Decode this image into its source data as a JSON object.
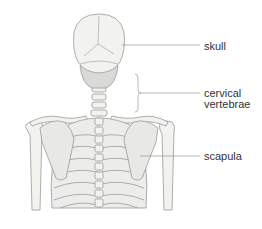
{
  "diagram": {
    "type": "anatomical-illustration",
    "colors": {
      "bone_fill": "#f2f2ef",
      "bone_outline": "#9a9a9a",
      "shadow": "#d9d9d6",
      "leader_line": "#888888",
      "label_text": "#333333"
    },
    "labels": [
      {
        "id": "skull",
        "text": "skull"
      },
      {
        "id": "cervical-vertebrae",
        "lines": [
          "cervical",
          "vertebrae"
        ]
      },
      {
        "id": "scapula",
        "text": "scapula"
      }
    ]
  }
}
